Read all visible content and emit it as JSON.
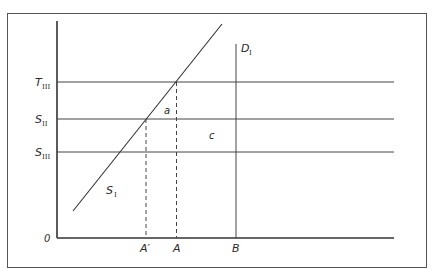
{
  "diagram": {
    "type": "supply-demand",
    "axes": {
      "origin_label": "0",
      "y_axis_labels": [
        {
          "main": "T",
          "sub": "III",
          "line": "T_III"
        },
        {
          "main": "S",
          "sub": "II",
          "line": "S_II"
        },
        {
          "main": "S",
          "sub": "III",
          "line": "S_III"
        }
      ],
      "x_axis_labels": [
        {
          "main": "A'",
          "line": "A-prime"
        },
        {
          "main": "A",
          "line": "A"
        },
        {
          "main": "B",
          "line": "B"
        }
      ]
    },
    "curves": {
      "supply": {
        "main": "S",
        "sub": "I"
      },
      "demand": {
        "main": "D",
        "sub": "I"
      }
    },
    "regions": {
      "a": "a",
      "c": "c"
    }
  },
  "labels": {
    "origin": "0",
    "t3_main": "T",
    "t3_sub": "III",
    "s2_main": "S",
    "s2_sub": "II",
    "s3_main": "S",
    "s3_sub": "III",
    "a_prime": "A′",
    "a": "A",
    "b": "B",
    "s1_main": "S",
    "s1_sub": "I",
    "d1_main": "D",
    "d1_sub": "I",
    "region_a": "a",
    "region_c": "c"
  }
}
